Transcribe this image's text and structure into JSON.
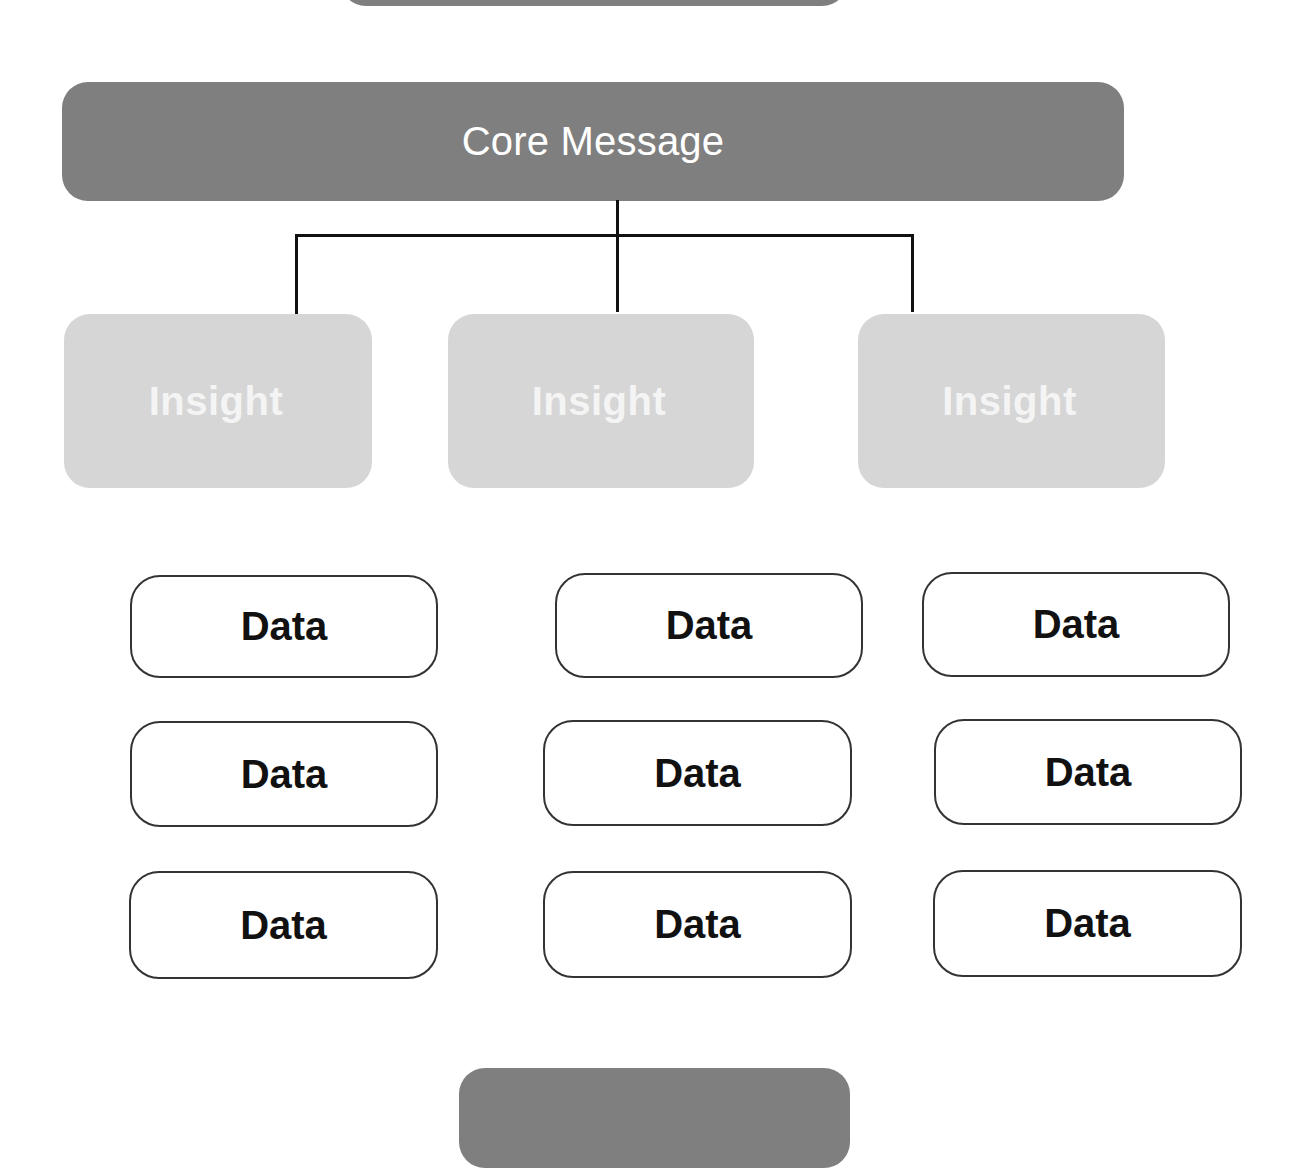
{
  "diagram": {
    "top_partial_box": {
      "label": ""
    },
    "core": {
      "label": "Core Message",
      "color": "#7f7f7f",
      "text_color": "#ffffff"
    },
    "insights": [
      {
        "label": "Insight"
      },
      {
        "label": "Insight"
      },
      {
        "label": "Insight"
      }
    ],
    "insight_color": "#d6d6d6",
    "data_rows": [
      [
        {
          "label": "Data"
        },
        {
          "label": "Data"
        },
        {
          "label": "Data"
        }
      ],
      [
        {
          "label": "Data"
        },
        {
          "label": "Data"
        },
        {
          "label": "Data"
        }
      ],
      [
        {
          "label": "Data"
        },
        {
          "label": "Data"
        },
        {
          "label": "Data"
        }
      ]
    ],
    "bottom_partial_box": {
      "label": ""
    },
    "connectors": {
      "from": "Core Message",
      "to": [
        "Insight 1",
        "Insight 2",
        "Insight 3"
      ]
    }
  }
}
